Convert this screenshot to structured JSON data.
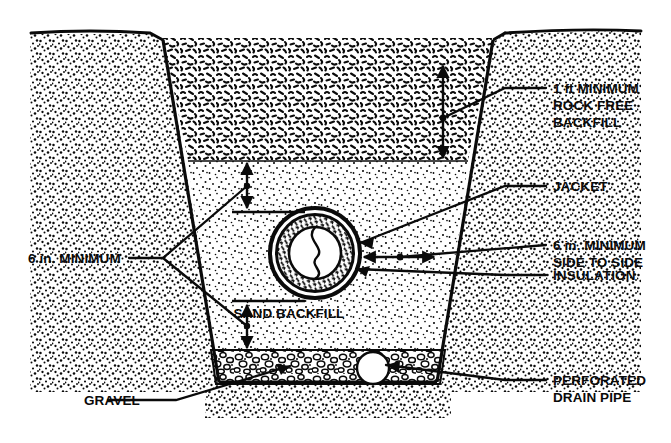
{
  "figure": {
    "ink_color": "#0a0a0a",
    "background_color": "#ffffff"
  },
  "labels": {
    "rock_free_backfill": {
      "line1": "1 ft MINIMUM",
      "line2": "ROCK FREE",
      "line3": "BACKFILL"
    },
    "jacket": "JACKET",
    "side_to_side": {
      "line1": "6 in. MINIMUM",
      "line2": "SIDE TO SIDE"
    },
    "insulation": "INSULATION",
    "perforated_drain_pipe": {
      "line1": "PERFORATED",
      "line2": "DRAIN PIPE"
    },
    "six_in_minimum": "6 in. MINIMUM",
    "gravel": "GRAVEL",
    "sand_backfill": "SAND BACKFILL"
  },
  "layers": [
    {
      "name": "native-soil",
      "texture": "stipple-dense"
    },
    {
      "name": "rock-free-backfill",
      "texture": "dash-squiggle"
    },
    {
      "name": "sand-backfill",
      "texture": "stipple-fine"
    },
    {
      "name": "gravel",
      "texture": "cobble-outline"
    }
  ],
  "components": [
    {
      "name": "jacket",
      "shape": "outer-ring"
    },
    {
      "name": "insulation",
      "shape": "hatched-ring"
    },
    {
      "name": "carrier-pipes",
      "shape": "twin-s-core"
    },
    {
      "name": "perforated-drain-pipe",
      "shape": "circle"
    }
  ],
  "dimensions": [
    {
      "name": "rock-free-backfill-depth",
      "value": "1 ft MINIMUM",
      "orientation": "vertical"
    },
    {
      "name": "cover-over-pipe",
      "value": "6 in. MINIMUM",
      "orientation": "vertical"
    },
    {
      "name": "bedding-under-pipe",
      "value": "6 in. MINIMUM",
      "orientation": "vertical"
    },
    {
      "name": "clearance-side-to-side",
      "value": "6 in. MINIMUM SIDE TO SIDE",
      "orientation": "horizontal"
    }
  ]
}
